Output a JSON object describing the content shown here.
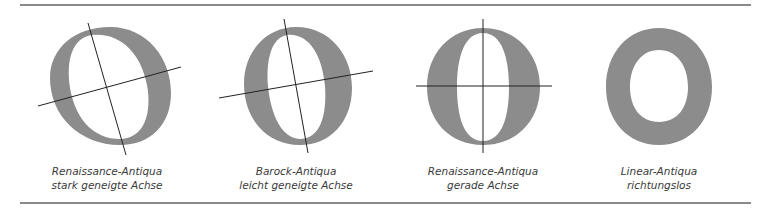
{
  "diagram": {
    "colors": {
      "letter_fill": "#8c8c8c",
      "axis_line": "#222222",
      "rule": "#8a8a8a",
      "caption_text": "#3a3a3a"
    },
    "panels": [
      {
        "letter": "O",
        "style": "Renaissance-Antiqua",
        "axis": "stark geneigte Achse",
        "caption_line1": "Renaissance-Antiqua",
        "caption_line2": "stark geneigte Achse"
      },
      {
        "letter": "O",
        "style": "Barock-Antiqua",
        "axis": "leicht geneigte Achse",
        "caption_line1": "Barock-Antiqua",
        "caption_line2": "leicht geneigte Achse"
      },
      {
        "letter": "O",
        "style": "Renaissance-Antiqua",
        "axis": "gerade Achse",
        "caption_line1": "Renaissance-Antiqua",
        "caption_line2": "gerade Achse"
      },
      {
        "letter": "O",
        "style": "Linear-Antiqua",
        "axis": "richtungslos",
        "caption_line1": "Linear-Antiqua",
        "caption_line2": "richtungslos"
      }
    ]
  }
}
